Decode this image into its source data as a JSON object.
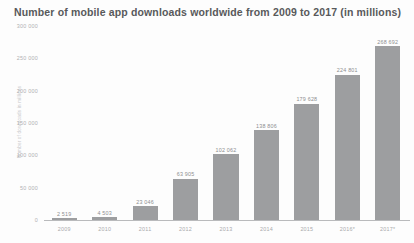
{
  "chart": {
    "title": "Number of mobile app downloads worldwide from 2009 to 2017 (in millions)",
    "y_axis_title": "Number of downloads in millions"
  },
  "chart_data": {
    "type": "bar",
    "title": "Number of mobile app downloads worldwide from 2009 to 2017 (in millions)",
    "xlabel": "",
    "ylabel": "Number of downloads in millions",
    "ylim": [
      0,
      300000
    ],
    "grid": false,
    "legend": null,
    "categories": [
      "2009",
      "2010",
      "2011",
      "2012",
      "2013",
      "2014",
      "2015",
      "2016*",
      "2017*"
    ],
    "values": [
      2519,
      4503,
      21646,
      63905,
      102062,
      138806,
      179628,
      224801,
      268692
    ],
    "value_labels": [
      "2 519",
      "4 503",
      "23 046",
      "63 905",
      "102 062",
      "138 806",
      "179 628",
      "224 801",
      "268 692"
    ],
    "yticks": [
      0,
      50000,
      100000,
      150000,
      200000,
      250000,
      300000
    ],
    "ytick_labels": [
      "0",
      "50 000",
      "100 000",
      "150 000",
      "200 000",
      "250 000",
      "300 000"
    ],
    "bar_color": "#9d9ea0",
    "text_color": "#a9aaac",
    "title_color": "#58595b"
  }
}
